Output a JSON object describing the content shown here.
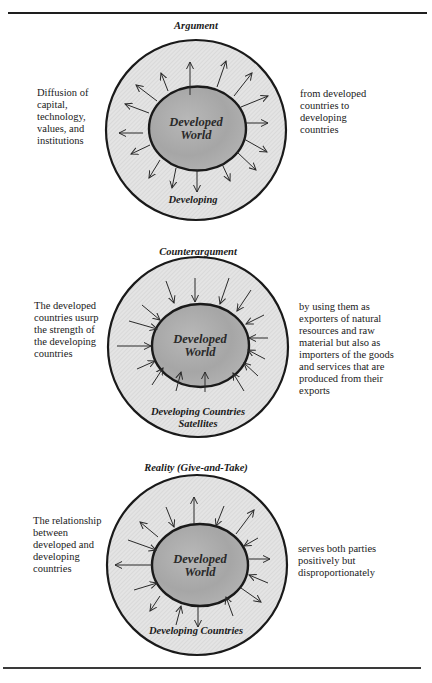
{
  "figure": {
    "colors": {
      "rule": "#1e1e1e",
      "outer_ring_fill": "#e2e2e2",
      "outer_ring_stroke": "#1a1a1a",
      "inner_fill_center": "#a4a4a4",
      "inner_fill_edge": "#c4c4c4",
      "arrow": "#2a2a2a"
    },
    "panels": [
      {
        "title": "Argument",
        "inner_label": "Developed\nWorld",
        "ring_label": "Developing",
        "left_text": "Diffusion of\ncapital,\ntechnology,\nvalues, and\ninstitutions",
        "right_text": "from developed\ncountries to\ndeveloping\ncountries",
        "arrow_direction": "outward"
      },
      {
        "title": "Counterargument",
        "inner_label": "Developed\nWorld",
        "ring_label": "Developing Countries\nSatellites",
        "left_text": "The developed\ncountries usurp\nthe strength of\nthe developing\ncountries",
        "right_text": "by using them as\nexporters of natural\nresources and raw\nmaterial but also as\nimporters of the goods\nand services that are\nproduced from their\nexports",
        "arrow_direction": "inward"
      },
      {
        "title": "Reality (Give-and-Take)",
        "inner_label": "Developed\nWorld",
        "ring_label": "Developing Countries",
        "left_text": "The relationship\nbetween\ndeveloped and\ndeveloping\ncountries",
        "right_text": "serves both parties\npositively but\ndisproportionately",
        "arrow_direction": "mixed"
      }
    ]
  }
}
